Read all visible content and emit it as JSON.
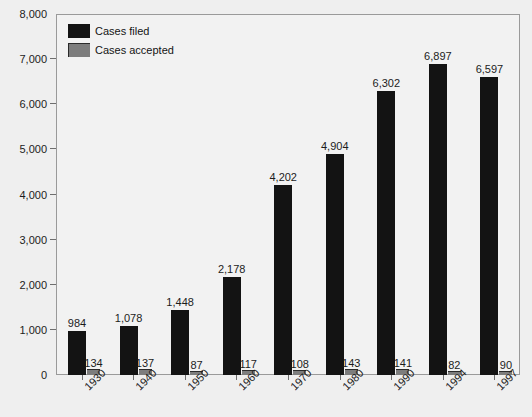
{
  "chart_data": {
    "type": "bar",
    "title": "",
    "xlabel": "",
    "ylabel": "",
    "ylim": [
      0,
      8000
    ],
    "ytick_labels": [
      "8,000",
      "7,000",
      "6,000",
      "5,000",
      "4,000",
      "3,000",
      "2,000",
      "1,000",
      "0"
    ],
    "ytick_values": [
      8000,
      7000,
      6000,
      5000,
      4000,
      3000,
      2000,
      1000,
      0
    ],
    "grid": false,
    "legend_position": "top-left",
    "categories": [
      "1930",
      "1940",
      "1950",
      "1960",
      "1970",
      "1980",
      "1990",
      "1994",
      "1997"
    ],
    "series": [
      {
        "name": "Cases filed",
        "color": "#131313",
        "values": [
          984,
          1078,
          1448,
          2178,
          4202,
          4904,
          6302,
          6897,
          6597
        ],
        "labels": [
          "984",
          "1,078",
          "1,448",
          "2,178",
          "4,202",
          "4,904",
          "6,302",
          "6,897",
          "6,597"
        ]
      },
      {
        "name": "Cases accepted",
        "color": "#7d7d7d",
        "values": [
          134,
          137,
          87,
          117,
          108,
          143,
          141,
          82,
          90
        ],
        "labels": [
          "134",
          "137",
          "87",
          "117",
          "108",
          "143",
          "141",
          "82",
          "90"
        ]
      }
    ]
  },
  "legend": {
    "items": [
      {
        "label": "Cases filed",
        "swatch": "filed"
      },
      {
        "label": "Cases accepted",
        "swatch": "accepted"
      }
    ]
  }
}
